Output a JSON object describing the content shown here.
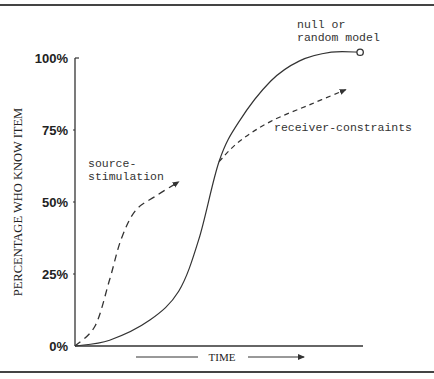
{
  "chart_data": {
    "type": "line",
    "title": "",
    "xlabel": "TIME",
    "ylabel": "PERCENTAGE WHO KNOW ITEM",
    "xlim": [
      0,
      1
    ],
    "ylim": [
      0,
      100
    ],
    "yticks": [
      0,
      25,
      50,
      75,
      100
    ],
    "ytick_labels": [
      "0%",
      "25%",
      "50%",
      "75%",
      "100%"
    ],
    "grid": false,
    "legend": "none",
    "series": [
      {
        "name": "null or random model",
        "style": "solid",
        "end_marker": "open-circle",
        "label_lines": [
          "null or",
          "random model"
        ],
        "x": [
          0,
          0.12,
          0.26,
          0.36,
          0.43,
          0.5,
          0.57,
          0.68,
          0.78,
          0.89,
          0.99
        ],
        "y": [
          0,
          2,
          9,
          19,
          37,
          64,
          78,
          92,
          99,
          102,
          102
        ]
      },
      {
        "name": "source-stimulation",
        "style": "dashed",
        "end_marker": "arrow",
        "label_lines": [
          "source-",
          "stimulation"
        ],
        "x": [
          0,
          0.07,
          0.12,
          0.16,
          0.21,
          0.28,
          0.36
        ],
        "y": [
          0,
          7,
          23,
          37,
          47,
          52,
          57
        ]
      },
      {
        "name": "receiver-constraints",
        "style": "dashed",
        "end_marker": "arrow",
        "label_lines": [
          "receiver-constraints"
        ],
        "x": [
          0.5,
          0.57,
          0.68,
          0.82,
          0.94
        ],
        "y": [
          64,
          71,
          78,
          84,
          89
        ]
      }
    ],
    "x_arrow": true
  }
}
